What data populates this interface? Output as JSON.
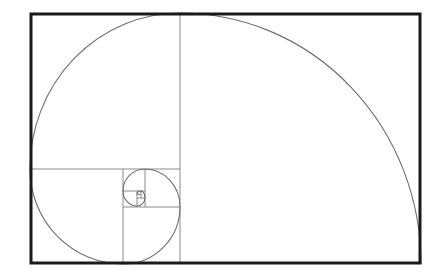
{
  "diagram": {
    "type": "golden-spiral",
    "colors": {
      "background": "#ffffff",
      "frame": "#1a1a1a",
      "grid": "#8a8a8a",
      "spiral": "#6e6e6e"
    },
    "frame": {
      "x": 30,
      "y": 13,
      "width": 391,
      "height": 251
    },
    "squares": [
      {
        "x": 180,
        "y": 13,
        "size": 241
      },
      {
        "x": 30,
        "y": 13,
        "size": 150
      },
      {
        "x": 30,
        "y": 169,
        "size": 93
      },
      {
        "x": 123,
        "y": 207,
        "size": 57
      },
      {
        "x": 145,
        "y": 169,
        "size": 36
      },
      {
        "x": 123,
        "y": 169,
        "size": 22
      },
      {
        "x": 123,
        "y": 191,
        "size": 14
      },
      {
        "x": 137,
        "y": 197,
        "size": 9
      },
      {
        "x": 137,
        "y": 191,
        "size": 6
      },
      {
        "x": 141,
        "y": 191,
        "size": 4
      }
    ]
  }
}
